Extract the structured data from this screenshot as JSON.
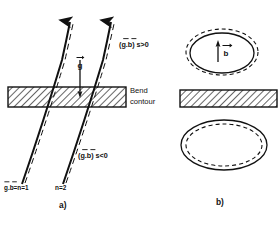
{
  "figure": {
    "panels": [
      {
        "id": "a",
        "label": "a)",
        "labels": {
          "g_vector": "g",
          "dot_positive": "(g.b) s>0",
          "dot_negative": "(g.b) s<0",
          "bend_contour_line1": "Bend",
          "bend_contour_line2": "contour",
          "n_equals_1": "g.b=n=1",
          "n_equals_2": "n=2"
        }
      },
      {
        "id": "b",
        "label": "b)",
        "labels": {
          "b_vector": "b"
        }
      }
    ],
    "colors": {
      "ink": "#111111",
      "background": "#ffffff",
      "hatch": "#333333"
    }
  }
}
